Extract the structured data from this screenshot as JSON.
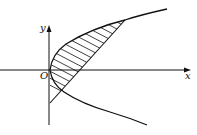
{
  "diagram": {
    "type": "region-between-curves",
    "labels": {
      "x_axis": "x",
      "y_axis": "y",
      "origin": "O"
    },
    "colors": {
      "stroke": "#111111",
      "background": "#ffffff"
    },
    "elements": [
      {
        "name": "x-axis",
        "kind": "axis"
      },
      {
        "name": "y-axis",
        "kind": "axis"
      },
      {
        "name": "parabola",
        "kind": "curve",
        "shape": "right-opening parabola with vertex at origin"
      },
      {
        "name": "line",
        "kind": "line",
        "shape": "line crossing y-axis below origin and meeting upper branch of parabola"
      },
      {
        "name": "shaded-region",
        "kind": "hatched area",
        "shape": "area between parabola upper branch and line"
      }
    ]
  }
}
